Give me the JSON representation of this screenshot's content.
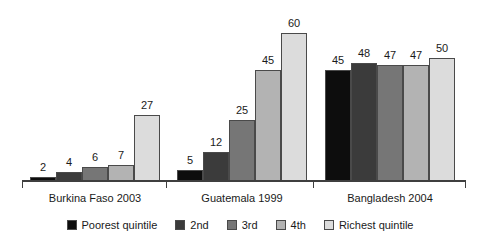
{
  "chart_data": {
    "type": "bar",
    "title": "",
    "subtitle": "",
    "xlabel": "",
    "ylabel": "",
    "grid": false,
    "legend_position": "bottom",
    "ylim": [
      0,
      60
    ],
    "categories": [
      "Burkina Faso 2003",
      "Guatemala 1999",
      "Bangladesh 2004"
    ],
    "series": [
      {
        "name": "Poorest quintile",
        "color": "#0d0d0d",
        "values": [
          2,
          5,
          45
        ]
      },
      {
        "name": "2nd",
        "color": "#3b3b3b",
        "values": [
          4,
          12,
          48
        ]
      },
      {
        "name": "3rd",
        "color": "#767676",
        "values": [
          6,
          25,
          47
        ]
      },
      {
        "name": "4th",
        "color": "#b3b3b3",
        "values": [
          7,
          45,
          47
        ]
      },
      {
        "name": "Richest quintile",
        "color": "#dcdcdc",
        "values": [
          27,
          60,
          50
        ]
      }
    ],
    "data_labels": {
      "Burkina Faso 2003": [
        "2",
        "4",
        "6",
        "7",
        "27"
      ],
      "Guatemala 1999": [
        "5",
        "12",
        "25",
        "45",
        "60"
      ],
      "Bangladesh 2004": [
        "45",
        "48",
        "47",
        "47",
        "50"
      ]
    }
  },
  "axis": {
    "tick_count": 4
  },
  "legend": {
    "items": [
      {
        "label": "Poorest quintile",
        "color": "#0d0d0d"
      },
      {
        "label": "2nd",
        "color": "#3b3b3b"
      },
      {
        "label": "3rd",
        "color": "#767676"
      },
      {
        "label": "4th",
        "color": "#b3b3b3"
      },
      {
        "label": "Richest quintile",
        "color": "#dcdcdc"
      }
    ]
  }
}
